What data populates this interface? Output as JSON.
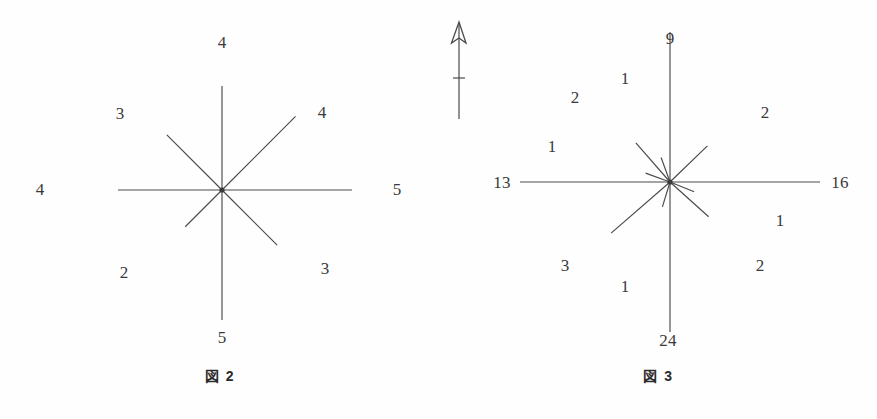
{
  "page": {
    "background_color": "#fefefe",
    "line_color": "#4a4a4a",
    "text_color": "#3a3a3a"
  },
  "north_arrow": {
    "name": "north-arrow",
    "description": "north-arrow-icon"
  },
  "figures": [
    {
      "id": "figure-2",
      "caption": "図 2",
      "center": {
        "x": 222,
        "y": 190
      }
    },
    {
      "id": "figure-3",
      "caption": "図 3",
      "center": {
        "x": 230,
        "y": 182
      }
    }
  ],
  "chart_data": [
    {
      "type": "rose",
      "title": "図 2",
      "center": {
        "x": 222,
        "y": 190
      },
      "xlabel": "",
      "ylabel": "",
      "grid": false,
      "legend": "none",
      "note": "Radial direction-frequency (rose) diagram: 8 rays at 45 degree intervals, ray length proportional to the labelled count.",
      "scale_px_per_unit": 26,
      "categories": [
        "N",
        "NE",
        "E",
        "SE",
        "S",
        "SW",
        "W",
        "NW"
      ],
      "values": [
        4,
        4,
        5,
        3,
        5,
        2,
        4,
        3
      ],
      "rays": [
        {
          "label": "4",
          "angle_deg": 90,
          "length": 4,
          "label_x": 222,
          "label_y": 42
        },
        {
          "label": "4",
          "angle_deg": 45,
          "length": 4,
          "label_x": 322,
          "label_y": 112
        },
        {
          "label": "5",
          "angle_deg": 0,
          "length": 5,
          "label_x": 397,
          "label_y": 189
        },
        {
          "label": "3",
          "angle_deg": -45,
          "length": 3,
          "label_x": 325,
          "label_y": 268
        },
        {
          "label": "5",
          "angle_deg": -90,
          "length": 5,
          "label_x": 222,
          "label_y": 337
        },
        {
          "label": "2",
          "angle_deg": -135,
          "length": 2,
          "label_x": 124,
          "label_y": 272
        },
        {
          "label": "4",
          "angle_deg": 180,
          "length": 4,
          "label_x": 40,
          "label_y": 189
        },
        {
          "label": "3",
          "angle_deg": 135,
          "length": 3,
          "label_x": 120,
          "label_y": 113
        }
      ]
    },
    {
      "type": "rose",
      "title": "図 3",
      "center": {
        "x": 230,
        "y": 182
      },
      "xlabel": "",
      "ylabel": "",
      "grid": false,
      "legend": "none",
      "note": "Radial direction-frequency (rose) diagram: 12 rays of varying azimuth, ray length proportional to the labelled count.",
      "scale_px_per_unit": 26,
      "categories": [
        "9",
        "2",
        "16",
        "1",
        "2",
        "24",
        "1",
        "3",
        "13",
        "1",
        "2",
        "1"
      ],
      "values": [
        9,
        2,
        16,
        1,
        2,
        24,
        1,
        3,
        13,
        1,
        2,
        1
      ],
      "rays": [
        {
          "label": "9",
          "angle_deg": 90,
          "length": 9,
          "label_x": 230,
          "label_y": 38
        },
        {
          "label": "2",
          "angle_deg": 44,
          "length": 2,
          "label_x": 325,
          "label_y": 112
        },
        {
          "label": "16",
          "angle_deg": 0,
          "length": 16,
          "label_x": 400,
          "label_y": 182
        },
        {
          "label": "1",
          "angle_deg": -22,
          "length": 1,
          "label_x": 340,
          "label_y": 220
        },
        {
          "label": "2",
          "angle_deg": -42,
          "length": 2,
          "label_x": 320,
          "label_y": 265
        },
        {
          "label": "24",
          "angle_deg": -90,
          "length": 24,
          "label_x": 228,
          "label_y": 340
        },
        {
          "label": "1",
          "angle_deg": -107,
          "length": 1,
          "label_x": 185,
          "label_y": 286
        },
        {
          "label": "3",
          "angle_deg": -139,
          "length": 3,
          "label_x": 125,
          "label_y": 265
        },
        {
          "label": "13",
          "angle_deg": 180,
          "length": 13,
          "label_x": 62,
          "label_y": 182
        },
        {
          "label": "1",
          "angle_deg": 160,
          "length": 1,
          "label_x": 112,
          "label_y": 146
        },
        {
          "label": "2",
          "angle_deg": 131,
          "length": 2,
          "label_x": 135,
          "label_y": 97
        },
        {
          "label": "1",
          "angle_deg": 110,
          "length": 1,
          "label_x": 185,
          "label_y": 78
        }
      ]
    }
  ]
}
